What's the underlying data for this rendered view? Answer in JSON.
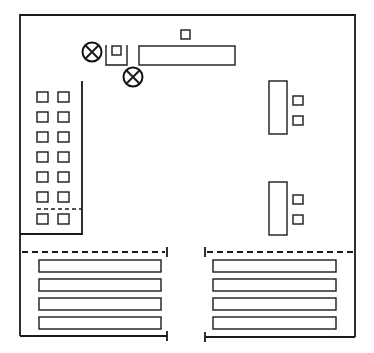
{
  "diagram": {
    "title": "",
    "type": "floor-plan",
    "colors": {
      "line": "#1a1a1a",
      "background": "#ffffff"
    },
    "elements": {
      "fixtures_x_circle": 2,
      "left_column_squares_rows": 7,
      "left_column_squares_cols": 2,
      "right_units": 2,
      "right_unit_squares_each": 2,
      "bottom_left_bars": 4,
      "bottom_right_bars": 4
    },
    "icons": {
      "fixture": "crossed-circle-icon",
      "seat": "square-icon"
    }
  }
}
